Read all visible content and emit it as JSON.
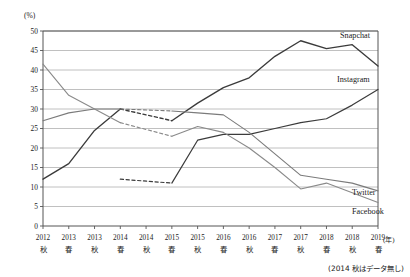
{
  "chart_data": {
    "type": "line",
    "title": "",
    "xlabel": "(年)",
    "ylabel": "(%)",
    "ylim": [
      0,
      50
    ],
    "ytick_step": 5,
    "yticks": [
      "0",
      "5",
      "10",
      "15",
      "20",
      "25",
      "30",
      "35",
      "40",
      "45",
      "50"
    ],
    "grid": true,
    "legend_position": "inline-right",
    "note": "(2014 秋はデータ無し)",
    "unit_label": "(%)",
    "year_axis_label": "(年)",
    "missing_point_index": 4,
    "categories": [
      "2012秋",
      "2013春",
      "2013秋",
      "2014春",
      "2014秋",
      "2015春",
      "2015秋",
      "2016春",
      "2016秋",
      "2017春",
      "2017秋",
      "2018春",
      "2018秋",
      "2019春"
    ],
    "xticks": [
      {
        "year": "2012",
        "season": "秋"
      },
      {
        "year": "2013",
        "season": "春"
      },
      {
        "year": "2013",
        "season": "秋"
      },
      {
        "year": "2014",
        "season": "春"
      },
      {
        "year": "2014",
        "season": "秋"
      },
      {
        "year": "2015",
        "season": "春"
      },
      {
        "year": "2015",
        "season": "秋"
      },
      {
        "year": "2016",
        "season": "春"
      },
      {
        "year": "2016",
        "season": "秋"
      },
      {
        "year": "2017",
        "season": "春"
      },
      {
        "year": "2017",
        "season": "秋"
      },
      {
        "year": "2018",
        "season": "春"
      },
      {
        "year": "2018",
        "season": "秋"
      },
      {
        "year": "2019",
        "season": "春"
      }
    ],
    "series": [
      {
        "name": "Snapchat",
        "color": "#3b3b3b",
        "width": 1.35,
        "label_x": 340,
        "label_y": 38,
        "values": [
          12.0,
          16.0,
          24.5,
          30.0,
          null,
          27.0,
          31.5,
          35.5,
          38.0,
          43.5,
          47.5,
          45.5,
          46.5,
          41.0
        ]
      },
      {
        "name": "Instagram",
        "color": "#3b3b3b",
        "width": 1.2,
        "label_x": 337,
        "label_y": 82,
        "values": [
          null,
          null,
          null,
          12.0,
          null,
          11.0,
          22.0,
          23.5,
          23.5,
          25.0,
          26.5,
          27.5,
          31.0,
          35.0
        ]
      },
      {
        "name": "Twitter",
        "color": "#7b7b7b",
        "width": 1.1,
        "label_x": 352,
        "label_y": 195,
        "values": [
          27.0,
          29.0,
          30.0,
          30.0,
          null,
          29.5,
          29.0,
          28.5,
          24.0,
          18.5,
          13.0,
          12.0,
          11.0,
          9.0
        ]
      },
      {
        "name": "Facebook",
        "color": "#8a8a8a",
        "width": 1.1,
        "label_x": 352,
        "label_y": 214,
        "values": [
          41.5,
          33.5,
          30.0,
          26.5,
          null,
          23.0,
          25.5,
          24.0,
          20.0,
          15.0,
          9.5,
          11.0,
          8.5,
          6.0
        ]
      }
    ],
    "dashed_bridges": [
      {
        "series": "Snapchat",
        "from_index": 3,
        "to_index": 5
      },
      {
        "series": "Instagram",
        "from_index": 3,
        "to_index": 5
      },
      {
        "series": "Twitter",
        "from_index": 3,
        "to_index": 5
      },
      {
        "series": "Facebook",
        "from_index": 3,
        "to_index": 5
      }
    ]
  }
}
